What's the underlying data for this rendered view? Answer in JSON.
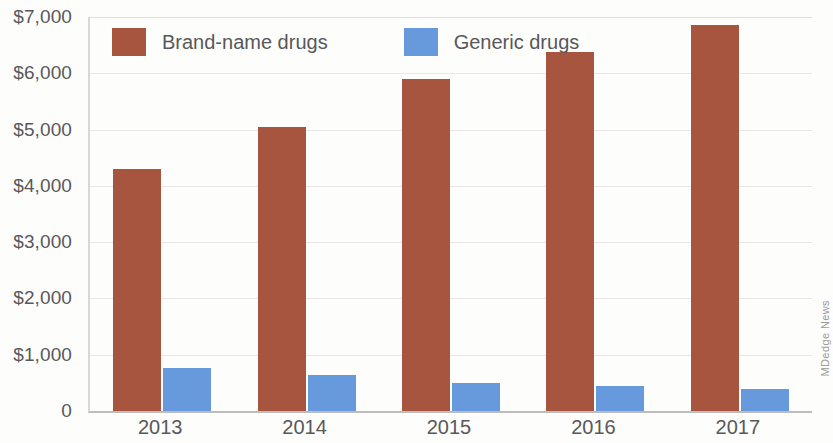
{
  "chart_data": {
    "type": "bar",
    "title": "",
    "xlabel": "",
    "ylabel": "",
    "categories": [
      "2013",
      "2014",
      "2015",
      "2016",
      "2017"
    ],
    "series": [
      {
        "name": "Brand-name drugs",
        "color": "#a85540",
        "values": [
          4300,
          5050,
          5900,
          6380,
          6850
        ]
      },
      {
        "name": "Generic drugs",
        "color": "#6799dd",
        "values": [
          770,
          640,
          500,
          450,
          390
        ]
      }
    ],
    "ylim": [
      0,
      7000
    ],
    "y_ticks": [
      0,
      1000,
      2000,
      3000,
      4000,
      5000,
      6000,
      7000
    ],
    "y_tick_labels": [
      "0",
      "$1,000",
      "$2,000",
      "$3,000",
      "$4,000",
      "$5,000",
      "$6,000",
      "$7,000"
    ],
    "grid": true,
    "legend_position": "top-left",
    "credit": "MDedge News"
  }
}
